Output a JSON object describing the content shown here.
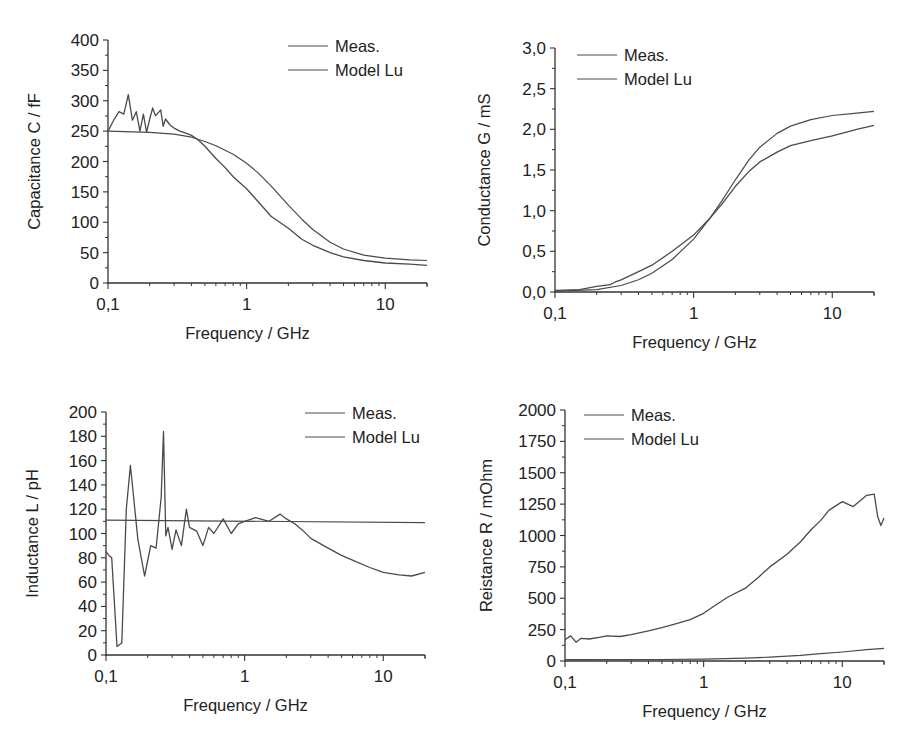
{
  "chart_data": [
    {
      "id": "capacitance",
      "type": "line",
      "xscale": "log",
      "xlabel": "Frequency / GHz",
      "ylabel": "Capacitance C / fF",
      "xlim": [
        0.1,
        20
      ],
      "ylim": [
        0,
        400
      ],
      "xticks": [
        {
          "v": 0.1,
          "label": "0,1"
        },
        {
          "v": 1,
          "label": "1"
        },
        {
          "v": 10,
          "label": "10"
        }
      ],
      "yticks": [
        {
          "v": 0,
          "label": "0"
        },
        {
          "v": 50,
          "label": "50"
        },
        {
          "v": 100,
          "label": "100"
        },
        {
          "v": 150,
          "label": "150"
        },
        {
          "v": 200,
          "label": "200"
        },
        {
          "v": 250,
          "label": "250"
        },
        {
          "v": 300,
          "label": "300"
        },
        {
          "v": 350,
          "label": "350"
        },
        {
          "v": 400,
          "label": "400"
        }
      ],
      "legend": {
        "position": "upper-right",
        "entries": [
          "Meas.",
          "Model Lu"
        ]
      },
      "series": [
        {
          "name": "Meas.",
          "x": [
            0.1,
            0.11,
            0.12,
            0.13,
            0.14,
            0.15,
            0.16,
            0.17,
            0.18,
            0.19,
            0.2,
            0.21,
            0.22,
            0.24,
            0.25,
            0.26,
            0.28,
            0.3,
            0.33,
            0.36,
            0.4,
            0.45,
            0.5,
            0.6,
            0.7,
            0.8,
            1.0,
            1.2,
            1.5,
            2.0,
            2.5,
            3.0,
            4.0,
            5.0,
            7.0,
            10.0,
            15.0,
            20.0
          ],
          "y": [
            250,
            268,
            282,
            278,
            310,
            268,
            282,
            250,
            278,
            248,
            270,
            288,
            275,
            285,
            258,
            270,
            260,
            255,
            250,
            247,
            243,
            235,
            225,
            205,
            190,
            175,
            155,
            135,
            110,
            90,
            72,
            62,
            50,
            43,
            37,
            33,
            31,
            29
          ]
        },
        {
          "name": "Model Lu",
          "x": [
            0.1,
            0.2,
            0.3,
            0.4,
            0.5,
            0.6,
            0.8,
            1.0,
            1.2,
            1.5,
            2.0,
            2.5,
            3.0,
            4.0,
            5.0,
            7.0,
            10.0,
            15.0,
            20.0
          ],
          "y": [
            250,
            248,
            245,
            240,
            233,
            226,
            212,
            197,
            182,
            160,
            128,
            105,
            88,
            67,
            56,
            46,
            41,
            38,
            37
          ]
        }
      ]
    },
    {
      "id": "conductance",
      "type": "line",
      "xscale": "log",
      "xlabel": "Frequency / GHz",
      "ylabel": "Conductance G / mS",
      "xlim": [
        0.1,
        20
      ],
      "ylim": [
        0,
        3.0
      ],
      "xticks": [
        {
          "v": 0.1,
          "label": "0,1"
        },
        {
          "v": 1,
          "label": "1"
        },
        {
          "v": 10,
          "label": "10"
        }
      ],
      "yticks": [
        {
          "v": 0,
          "label": "0,0"
        },
        {
          "v": 0.5,
          "label": "0,5"
        },
        {
          "v": 1.0,
          "label": "1,0"
        },
        {
          "v": 1.5,
          "label": "1,5"
        },
        {
          "v": 2.0,
          "label": "2,0"
        },
        {
          "v": 2.5,
          "label": "2,5"
        },
        {
          "v": 3.0,
          "label": "3,0"
        }
      ],
      "legend": {
        "position": "upper-left",
        "entries": [
          "Meas.",
          "Model Lu"
        ]
      },
      "series": [
        {
          "name": "Meas.",
          "x": [
            0.1,
            0.15,
            0.2,
            0.25,
            0.27,
            0.3,
            0.4,
            0.5,
            0.7,
            1.0,
            1.3,
            1.6,
            2.0,
            2.5,
            3.0,
            4.0,
            5.0,
            7.0,
            10.0,
            15.0,
            20.0
          ],
          "y": [
            0.02,
            0.03,
            0.07,
            0.09,
            0.12,
            0.15,
            0.25,
            0.33,
            0.5,
            0.7,
            0.9,
            1.08,
            1.3,
            1.48,
            1.6,
            1.72,
            1.8,
            1.86,
            1.92,
            2.0,
            2.05
          ]
        },
        {
          "name": "Model Lu",
          "x": [
            0.1,
            0.2,
            0.3,
            0.4,
            0.5,
            0.7,
            1.0,
            1.3,
            1.6,
            2.0,
            2.5,
            3.0,
            4.0,
            5.0,
            7.0,
            10.0,
            15.0,
            20.0
          ],
          "y": [
            0.01,
            0.03,
            0.08,
            0.15,
            0.23,
            0.4,
            0.65,
            0.9,
            1.12,
            1.38,
            1.62,
            1.78,
            1.95,
            2.04,
            2.12,
            2.17,
            2.2,
            2.22
          ]
        }
      ]
    },
    {
      "id": "inductance",
      "type": "line",
      "xscale": "log",
      "xlabel": "Frequency / GHz",
      "ylabel": "Inductance L / pH",
      "xlim": [
        0.1,
        20
      ],
      "ylim": [
        0,
        200
      ],
      "xticks": [
        {
          "v": 0.1,
          "label": "0,1"
        },
        {
          "v": 1,
          "label": "1"
        },
        {
          "v": 10,
          "label": "10"
        }
      ],
      "yticks": [
        {
          "v": 0,
          "label": "0"
        },
        {
          "v": 20,
          "label": "20"
        },
        {
          "v": 40,
          "label": "40"
        },
        {
          "v": 60,
          "label": "60"
        },
        {
          "v": 80,
          "label": "80"
        },
        {
          "v": 100,
          "label": "100"
        },
        {
          "v": 120,
          "label": "120"
        },
        {
          "v": 140,
          "label": "140"
        },
        {
          "v": 160,
          "label": "160"
        },
        {
          "v": 180,
          "label": "180"
        },
        {
          "v": 200,
          "label": "200"
        }
      ],
      "legend": {
        "position": "upper-right",
        "entries": [
          "Meas.",
          "Model Lu"
        ]
      },
      "series": [
        {
          "name": "Meas.",
          "x": [
            0.1,
            0.105,
            0.11,
            0.12,
            0.13,
            0.14,
            0.15,
            0.17,
            0.19,
            0.21,
            0.23,
            0.25,
            0.26,
            0.27,
            0.28,
            0.3,
            0.32,
            0.35,
            0.38,
            0.4,
            0.45,
            0.5,
            0.55,
            0.6,
            0.7,
            0.8,
            0.9,
            1.0,
            1.2,
            1.5,
            1.8,
            2.0,
            2.3,
            2.6,
            3.0,
            4.0,
            5.0,
            6.0,
            8.0,
            10.0,
            13.0,
            16.0,
            20.0
          ],
          "y": [
            85,
            82,
            80,
            7,
            10,
            120,
            156,
            95,
            65,
            90,
            88,
            130,
            184,
            98,
            105,
            87,
            103,
            90,
            120,
            105,
            102,
            90,
            105,
            100,
            112,
            100,
            108,
            110,
            113,
            110,
            116,
            112,
            108,
            103,
            96,
            88,
            82,
            78,
            72,
            68,
            66,
            65,
            68
          ]
        },
        {
          "name": "Model Lu",
          "x": [
            0.1,
            20.0
          ],
          "y": [
            111,
            109
          ]
        }
      ]
    },
    {
      "id": "resistance",
      "type": "line",
      "xscale": "log",
      "xlabel": "Frequency / GHz",
      "ylabel": "Reistance R / mOhm",
      "xlim": [
        0.1,
        20
      ],
      "ylim": [
        0,
        2000
      ],
      "xticks": [
        {
          "v": 0.1,
          "label": "0,1"
        },
        {
          "v": 1,
          "label": "1"
        },
        {
          "v": 10,
          "label": "10"
        }
      ],
      "yticks": [
        {
          "v": 0,
          "label": "0"
        },
        {
          "v": 250,
          "label": "250"
        },
        {
          "v": 500,
          "label": "500"
        },
        {
          "v": 750,
          "label": "750"
        },
        {
          "v": 1000,
          "label": "1000"
        },
        {
          "v": 1250,
          "label": "1250"
        },
        {
          "v": 1500,
          "label": "1500"
        },
        {
          "v": 1750,
          "label": "1750"
        },
        {
          "v": 2000,
          "label": "2000"
        }
      ],
      "legend": {
        "position": "upper-left",
        "entries": [
          "Meas.",
          "Model Lu"
        ]
      },
      "series": [
        {
          "name": "Meas.",
          "x": [
            0.1,
            0.11,
            0.12,
            0.13,
            0.15,
            0.18,
            0.2,
            0.25,
            0.3,
            0.4,
            0.5,
            0.6,
            0.8,
            1.0,
            1.2,
            1.5,
            2.0,
            2.5,
            3.0,
            4.0,
            5.0,
            6.0,
            7.0,
            8.0,
            10.0,
            12.0,
            15.0,
            17.0,
            18.0,
            19.0,
            20.0
          ],
          "y": [
            170,
            200,
            150,
            180,
            175,
            190,
            200,
            195,
            210,
            240,
            265,
            290,
            330,
            380,
            440,
            510,
            580,
            670,
            750,
            850,
            950,
            1050,
            1120,
            1200,
            1270,
            1230,
            1320,
            1330,
            1150,
            1080,
            1140
          ]
        },
        {
          "name": "Model Lu",
          "x": [
            0.1,
            0.5,
            1.0,
            2.0,
            3.0,
            5.0,
            7.0,
            10.0,
            15.0,
            20.0
          ],
          "y": [
            10,
            12,
            15,
            22,
            30,
            45,
            58,
            72,
            90,
            100
          ]
        }
      ]
    }
  ]
}
